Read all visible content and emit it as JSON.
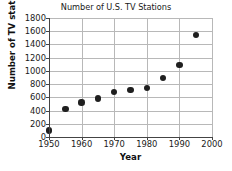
{
  "chart_data": {
    "type": "scatter",
    "title": "Number of U.S. TV Stations",
    "xlabel": "Year",
    "ylabel": "Number of TV stations",
    "x": [
      1950,
      1955,
      1960,
      1965,
      1970,
      1975,
      1980,
      1985,
      1990,
      1995
    ],
    "values": [
      100,
      420,
      520,
      580,
      680,
      710,
      740,
      890,
      1090,
      1540
    ],
    "series": [
      {
        "name": "Number of TV stations",
        "values": [
          100,
          420,
          520,
          580,
          680,
          710,
          740,
          890,
          1090,
          1540
        ]
      }
    ],
    "points": [
      {
        "x": 1950,
        "y": 100
      },
      {
        "x": 1955,
        "y": 420
      },
      {
        "x": 1960,
        "y": 520
      },
      {
        "x": 1965,
        "y": 580
      },
      {
        "x": 1970,
        "y": 680
      },
      {
        "x": 1975,
        "y": 710
      },
      {
        "x": 1980,
        "y": 740
      },
      {
        "x": 1985,
        "y": 890
      },
      {
        "x": 1990,
        "y": 1090
      },
      {
        "x": 1995,
        "y": 1540
      }
    ],
    "xlim": [
      1950,
      2000
    ],
    "ylim": [
      0,
      1800
    ],
    "xticks": [
      1950,
      1960,
      1970,
      1980,
      1990,
      2000
    ],
    "yticks": [
      0,
      200,
      400,
      600,
      800,
      1000,
      1200,
      1400,
      1600,
      1800
    ],
    "xtick_labels": [
      "1950",
      "1960",
      "1970",
      "1980",
      "1990",
      "2000"
    ],
    "ytick_labels": [
      "0",
      "200",
      "400",
      "600",
      "800",
      "1000",
      "1200",
      "1400",
      "1600",
      "1800"
    ],
    "grid": true,
    "grid_axis": "both",
    "legend": false,
    "legend_position": "none",
    "marker": "filled-circle",
    "marker_color": "#1f1f1f",
    "grid_color": "#b8b8b8",
    "axis_color": "#444444",
    "background_color": "#ffffff"
  }
}
